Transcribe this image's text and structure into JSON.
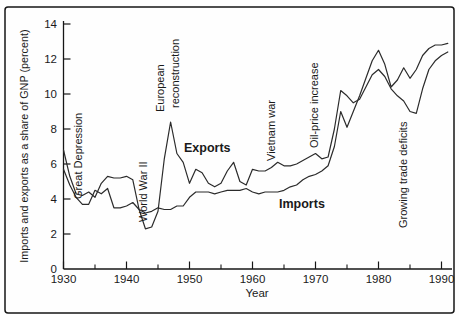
{
  "figure": {
    "background": "#fefefe",
    "frame_color": "#161616"
  },
  "chart_data": {
    "type": "line",
    "title": "",
    "xlabel": "Year",
    "ylabel": "Imports and exports as a share of GNP (percent)",
    "x_range": [
      1930,
      1992
    ],
    "y_range": [
      0,
      14
    ],
    "grid": "off",
    "legend": "inline-labels",
    "x_tick_labels": [
      1930,
      1940,
      1950,
      1960,
      1970,
      1980,
      1990
    ],
    "x_minor_ticks": [
      1935,
      1945,
      1955,
      1965,
      1975,
      1985
    ],
    "y_ticks": [
      0,
      2,
      4,
      6,
      8,
      10,
      12,
      14
    ],
    "year_start": 1930,
    "line_color": "#2b2b2b",
    "series": [
      {
        "name": "Exports",
        "label_pos": {
          "x": 184,
          "y": 152
        },
        "values": [
          6.8,
          5.3,
          4.3,
          4.2,
          4.4,
          4.1,
          4.9,
          5.3,
          5.2,
          5.2,
          5.3,
          5.1,
          3.4,
          2.3,
          2.4,
          3.3,
          6.3,
          8.4,
          6.6,
          6.1,
          4.9,
          5.7,
          5.5,
          4.9,
          4.7,
          4.9,
          5.6,
          6.1,
          5.0,
          4.8,
          5.7,
          5.6,
          5.6,
          5.8,
          6.1,
          5.9,
          5.9,
          6.0,
          6.2,
          6.4,
          6.6,
          6.3,
          6.4,
          8.0,
          10.2,
          9.9,
          9.5,
          9.7,
          10.4,
          11.1,
          11.4,
          11.0,
          10.3,
          9.9,
          9.6,
          9.0,
          8.9,
          10.3,
          11.4,
          11.9,
          12.2,
          12.4
        ]
      },
      {
        "name": "Imports",
        "label_pos": {
          "x": 279,
          "y": 208
        },
        "values": [
          5.7,
          4.8,
          4.1,
          3.7,
          3.7,
          4.5,
          4.3,
          4.6,
          3.5,
          3.5,
          3.6,
          3.8,
          3.4,
          3.2,
          3.3,
          3.5,
          3.4,
          3.4,
          3.6,
          3.6,
          4.1,
          4.4,
          4.4,
          4.4,
          4.3,
          4.4,
          4.5,
          4.5,
          4.5,
          4.6,
          4.4,
          4.3,
          4.4,
          4.4,
          4.4,
          4.5,
          4.7,
          4.8,
          5.1,
          5.3,
          5.4,
          5.6,
          5.9,
          7.0,
          9.0,
          8.1,
          9.0,
          9.9,
          10.9,
          11.9,
          12.5,
          11.7,
          10.4,
          10.8,
          11.5,
          10.9,
          11.4,
          12.2,
          12.6,
          12.8,
          12.8,
          12.9
        ]
      }
    ],
    "annotations": [
      {
        "id": "great-depression",
        "text": "Great Depression",
        "x": 82,
        "y": 199
      },
      {
        "id": "world-war-ii",
        "text": "World War II",
        "x": 147,
        "y": 222
      },
      {
        "id": "european",
        "text": "European",
        "x": 164,
        "y": 112
      },
      {
        "id": "reconstruction",
        "text": "reconstruction",
        "x": 179,
        "y": 108
      },
      {
        "id": "vietnam-war",
        "text": "Vietnam war",
        "x": 275,
        "y": 161
      },
      {
        "id": "oil-price-increase",
        "text": "Oil-price increase",
        "x": 318,
        "y": 148
      },
      {
        "id": "growing-trade-deficits",
        "text": "Growing trade deficits",
        "x": 407,
        "y": 228
      }
    ]
  }
}
